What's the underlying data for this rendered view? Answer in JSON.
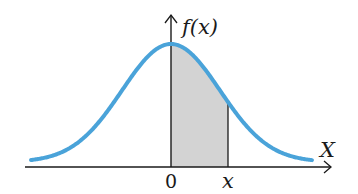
{
  "figure": {
    "y_axis_label": "f(x)",
    "x_axis_label": "X",
    "origin_label": "0",
    "x_marker_label": "x",
    "colors": {
      "curve": "#4aa3d9",
      "shade": "#d3d3d3",
      "axis": "#1a1a1a",
      "background": "#ffffff"
    }
  },
  "chart_data": {
    "type": "area",
    "title": "",
    "xlabel": "X",
    "ylabel": "f(x)",
    "distribution": "standard normal (bell curve)",
    "mean": 0,
    "shaded_interval": [
      "0",
      "x"
    ],
    "x_ticks": [
      "0",
      "x"
    ],
    "grid": false,
    "legend": null
  },
  "geometry": {
    "origin_px": [
      171,
      167
    ],
    "peak_y_px": 44,
    "sigma_px": 49,
    "curve_x_range_px": [
      31,
      312
    ],
    "end_lift_px": 5,
    "x_marker_px": 228,
    "x_axis_range_px": [
      25,
      331
    ],
    "y_axis_top_px": 15
  }
}
